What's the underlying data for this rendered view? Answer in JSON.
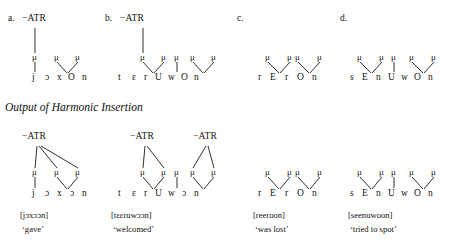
{
  "figure": {
    "section_heading": "Output of Harmonic Insertion",
    "feature_label": "−ATR",
    "mora_symbol": "μ"
  },
  "input_row": {
    "items": [
      {
        "id": "a",
        "label": "a.",
        "segments": [
          "j",
          "ɔ",
          "x",
          "O",
          "n"
        ],
        "moras": 3,
        "atr_nodes": 1
      },
      {
        "id": "b",
        "label": "b.",
        "segments": [
          "t",
          "ɛ",
          "r",
          "U",
          "w",
          "O",
          "n"
        ],
        "moras": 5,
        "atr_nodes": 1
      },
      {
        "id": "c",
        "label": "c.",
        "segments": [
          "r",
          "E",
          "r",
          "O",
          "n"
        ],
        "moras": 4,
        "atr_nodes": 0
      },
      {
        "id": "d",
        "label": "d.",
        "segments": [
          "s",
          "E",
          "n",
          "U",
          "w",
          "O",
          "n"
        ],
        "moras": 5,
        "atr_nodes": 0
      }
    ]
  },
  "output_row": {
    "items": [
      {
        "id": "a",
        "segments": [
          "j",
          "ɔ",
          "x",
          "ɔ",
          "n"
        ],
        "moras": 3,
        "atr_nodes": 1,
        "transcription": "[jɔxɔɔn]",
        "gloss": "‘gave’"
      },
      {
        "id": "b",
        "segments": [
          "t",
          "ɛ",
          "r",
          "U",
          "w",
          "ɔ",
          "n"
        ],
        "moras": 5,
        "atr_nodes": 2,
        "transcription": "[tɛɛruwɔɔn]",
        "gloss": "‘welcomed’"
      },
      {
        "id": "c",
        "segments": [
          "r",
          "E",
          "r",
          "O",
          "n"
        ],
        "moras": 4,
        "atr_nodes": 0,
        "transcription": "[reeroon]",
        "gloss": "‘was lost’"
      },
      {
        "id": "d",
        "segments": [
          "s",
          "E",
          "n",
          "U",
          "w",
          "O",
          "n"
        ],
        "moras": 5,
        "atr_nodes": 0,
        "transcription": "[seenuwoon]",
        "gloss": "‘tried to spot’"
      }
    ]
  }
}
